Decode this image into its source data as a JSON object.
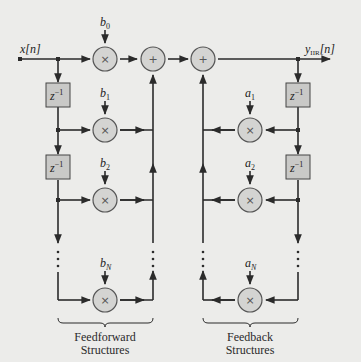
{
  "diagram": {
    "type": "IIR filter direct form block diagram",
    "input_label": "x[n]",
    "output_label": "y",
    "output_subscript": "IIR",
    "output_suffix": "[n]",
    "delay_label": "z",
    "delay_exponent": "−1",
    "multiply_symbol": "×",
    "add_symbol": "+",
    "feedforward": {
      "coefficients": [
        {
          "base": "b",
          "sub": "0"
        },
        {
          "base": "b",
          "sub": "1"
        },
        {
          "base": "b",
          "sub": "2"
        },
        {
          "base": "b",
          "sub": "N"
        }
      ],
      "caption_line1": "Feedforward",
      "caption_line2": "Structures"
    },
    "feedback": {
      "coefficients": [
        {
          "base": "a",
          "sub": "1"
        },
        {
          "base": "a",
          "sub": "2"
        },
        {
          "base": "a",
          "sub": "N"
        }
      ],
      "caption_line1": "Feedback",
      "caption_line2": "Structures"
    },
    "colors": {
      "background": "#ececea",
      "line": "#2b2b2b",
      "node_fill": "#d4d4d2",
      "delay_fill": "#c9c9c7"
    }
  }
}
